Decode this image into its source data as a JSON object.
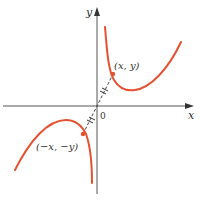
{
  "diagram": {
    "type": "odd-function-symmetry",
    "axes": {
      "x_label": "x",
      "y_label": "y",
      "origin_label": "0"
    },
    "points": {
      "p1_label": "(x, y)",
      "p2_label": "(−x, −y)"
    },
    "colors": {
      "curve": "#e5502e",
      "axis": "#555555",
      "dashed": "#444444"
    }
  }
}
